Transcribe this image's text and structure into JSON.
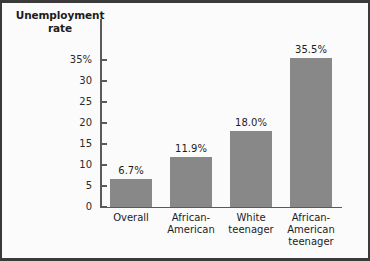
{
  "chart_data": {
    "type": "bar",
    "title": "Unemployment rate",
    "title_line1": "Unemployment",
    "title_line2": "rate",
    "xlabel": "",
    "ylabel": "Unemployment rate",
    "ylim": [
      0,
      37
    ],
    "grid": false,
    "legend": null,
    "bar_color": "#888888",
    "axis_color": "#5a5a5a",
    "background_color": "#fbfbfb",
    "frame_color": "#3a3a3a",
    "categories": [
      "Overall",
      "African-American",
      "White teenager",
      "African-American teenager"
    ],
    "category_lines": [
      [
        "Overall"
      ],
      [
        "African-",
        "American"
      ],
      [
        "White",
        "teenager"
      ],
      [
        "African-",
        "American",
        "teenager"
      ]
    ],
    "values": [
      6.7,
      11.9,
      18.0,
      35.5
    ],
    "data_labels": [
      "6.7%",
      "11.9%",
      "18.0%",
      "35.5%"
    ],
    "yticks": [
      0,
      5,
      10,
      15,
      20,
      25,
      30,
      35
    ],
    "ytick_labels": [
      "0",
      "5",
      "10",
      "15",
      "20",
      "25",
      "30",
      "35%"
    ]
  }
}
